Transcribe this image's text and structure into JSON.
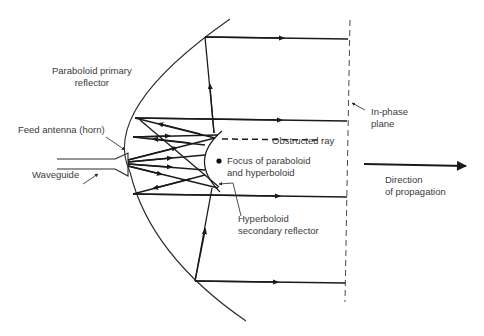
{
  "diagram": {
    "labels": {
      "primary_reflector": [
        "Paraboloid primary",
        "reflector"
      ],
      "feed_antenna": "Feed antenna (horn)",
      "waveguide": "Waveguide",
      "obstructed_ray": "Obstructed ray",
      "focus": [
        "Focus of paraboloid",
        "and hyperboloid"
      ],
      "secondary_reflector": [
        "Hyperboloid",
        "secondary reflector"
      ],
      "in_phase_plane": [
        "In-phase",
        "plane"
      ],
      "direction": [
        "Direction",
        "of propagation"
      ]
    },
    "colors": {
      "line": "#1a1a1a",
      "text": "#3a3a3a",
      "background": "#ffffff"
    }
  }
}
